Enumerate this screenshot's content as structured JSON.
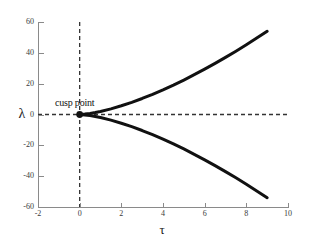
{
  "figure": {
    "background_color": "#ffffff",
    "curve_color": "#111111",
    "axis_color": "#8a8a8a",
    "dash_color": "#333333"
  },
  "annotations": [
    {
      "name": "cusp-point",
      "text": "cusp point",
      "x": 0,
      "y": 0,
      "marker": "filled-circle"
    }
  ],
  "chart_data": {
    "type": "line",
    "title": "",
    "xlabel": "τ",
    "ylabel": "λ",
    "xlim": [
      -2,
      10
    ],
    "ylim": [
      -60,
      60
    ],
    "xticks": [
      -2,
      0,
      2,
      4,
      6,
      8,
      10
    ],
    "xticklabels": [
      "-2",
      "0",
      "2",
      "4",
      "6",
      "8",
      "10"
    ],
    "yticks": [
      -60,
      -40,
      -20,
      0,
      20,
      40,
      60
    ],
    "yticklabels": [
      "-60",
      "-40",
      "-20",
      "0",
      "20",
      "40",
      "60"
    ],
    "grid": false,
    "legend": false,
    "equation": "λ = ±2τ^1.5",
    "series": [
      {
        "name": "upper-branch",
        "style": "solid",
        "linewidth": 3,
        "color": "#111111",
        "x": [
          0,
          0.25,
          0.5,
          0.75,
          1,
          1.5,
          2,
          2.5,
          3,
          3.5,
          4,
          4.5,
          5,
          5.5,
          6,
          6.5,
          7,
          7.5,
          8,
          8.5,
          9
        ],
        "values": [
          0,
          0.25,
          0.71,
          1.3,
          2,
          3.67,
          5.66,
          7.91,
          10.39,
          13.1,
          16,
          19.09,
          22.36,
          25.81,
          29.39,
          33.15,
          37.04,
          41.08,
          45.25,
          49.56,
          54
        ]
      },
      {
        "name": "lower-branch",
        "style": "solid",
        "linewidth": 3,
        "color": "#111111",
        "x": [
          0,
          0.25,
          0.5,
          0.75,
          1,
          1.5,
          2,
          2.5,
          3,
          3.5,
          4,
          4.5,
          5,
          5.5,
          6,
          6.5,
          7,
          7.5,
          8,
          8.5,
          9
        ],
        "values": [
          0,
          -0.25,
          -0.71,
          -1.3,
          -2,
          -3.67,
          -5.66,
          -7.91,
          -10.39,
          -13.1,
          -16,
          -19.09,
          -22.36,
          -25.81,
          -29.39,
          -33.15,
          -37.04,
          -41.08,
          -45.25,
          -49.56,
          -54
        ]
      }
    ],
    "reference_lines": [
      {
        "name": "vertical-zero-line",
        "orientation": "vertical",
        "value": 0,
        "style": "dashed"
      },
      {
        "name": "horizontal-zero-line",
        "orientation": "horizontal",
        "value": 0,
        "style": "dashed"
      }
    ]
  }
}
